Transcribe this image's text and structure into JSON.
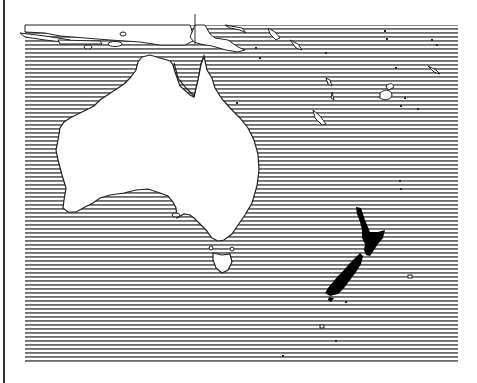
{
  "map": {
    "title": "Australia and New Zealand",
    "highlighted_region": "New Zealand",
    "regions": [
      {
        "name": "Australia",
        "fill": "#ffffff"
      },
      {
        "name": "Tasmania",
        "fill": "#ffffff"
      },
      {
        "name": "New Zealand",
        "fill": "#000000"
      },
      {
        "name": "Ocean",
        "fill": "hatched"
      }
    ],
    "colors": {
      "hatch_line": "#6b6b6b",
      "land_outline": "#222222",
      "highlight": "#000000",
      "background": "#ffffff"
    }
  }
}
